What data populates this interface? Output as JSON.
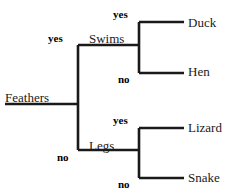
{
  "diagram": {
    "type": "decision-tree",
    "title": "",
    "line_color": "#1a1a1a",
    "text_color": "#1a1a1a",
    "background": "#ffffff",
    "root": {
      "label": "Feathers",
      "x": 5,
      "y": 91
    },
    "internal_nodes": [
      {
        "label": "Swims",
        "x": 89,
        "y": 32
      },
      {
        "label": "Legs",
        "x": 89,
        "y": 139
      }
    ],
    "leaves": [
      {
        "label": "Duck",
        "x": 188,
        "y": 16
      },
      {
        "label": "Hen",
        "x": 188,
        "y": 65
      },
      {
        "label": "Lizard",
        "x": 188,
        "y": 121
      },
      {
        "label": "Snake",
        "x": 188,
        "y": 171
      }
    ],
    "edge_labels": [
      {
        "label": "yes",
        "x": 48,
        "y": 33
      },
      {
        "label": "no",
        "x": 57,
        "y": 152
      },
      {
        "label": "yes",
        "x": 113,
        "y": 9
      },
      {
        "label": "no",
        "x": 118,
        "y": 74
      },
      {
        "label": "yes",
        "x": 113,
        "y": 115
      },
      {
        "label": "no",
        "x": 118,
        "y": 179
      }
    ],
    "edges": [
      {
        "name": "root-to-trunk",
        "d": "M 5 104 L 78 104"
      },
      {
        "name": "main-trunk",
        "d": "M 78 45 L 78 150"
      },
      {
        "name": "trunk-to-swims",
        "d": "M 78 45 L 139 45"
      },
      {
        "name": "trunk-to-legs",
        "d": "M 78 150 L 139 150"
      },
      {
        "name": "swims-splitter",
        "d": "M 139 22 L 139 73"
      },
      {
        "name": "swims-yes-to-duck",
        "d": "M 139 22 L 184 22"
      },
      {
        "name": "swims-no-to-hen",
        "d": "M 139 73 L 184 73"
      },
      {
        "name": "legs-splitter",
        "d": "M 139 128 L 139 178"
      },
      {
        "name": "legs-yes-to-lizard",
        "d": "M 139 128 L 184 128"
      },
      {
        "name": "legs-no-to-snake",
        "d": "M 139 178 L 184 178"
      }
    ]
  }
}
